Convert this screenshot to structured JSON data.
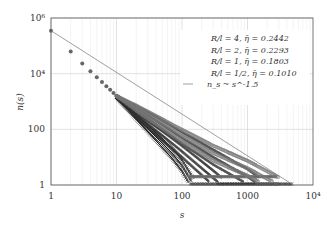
{
  "chart_data": {
    "type": "scatter",
    "title": "",
    "xlabel": "s",
    "ylabel": "n(s)",
    "xscale": "log",
    "yscale": "log",
    "xlim": [
      1,
      10000
    ],
    "ylim": [
      1,
      1000000
    ],
    "grid": true,
    "legend_position": "upper right",
    "x_ticks": [
      "1",
      "10",
      "100",
      "1000",
      "10^4"
    ],
    "y_ticks": [
      "1",
      "100",
      "10^4",
      "10^6"
    ],
    "series": [
      {
        "name": "R/l = 4, η̄ = 0.2442",
        "marker": "×",
        "color": "#111111",
        "approx_cutoff_s": 150,
        "max_s": 5000,
        "points": [
          [
            1,
            350000
          ],
          [
            2,
            60000
          ],
          [
            3,
            22000
          ],
          [
            5,
            7000
          ],
          [
            10,
            1400
          ],
          [
            20,
            280
          ],
          [
            40,
            55
          ],
          [
            70,
            14
          ],
          [
            100,
            5
          ],
          [
            150,
            1
          ]
        ]
      },
      {
        "name": "R/l = 2, η̄ = 0.2293",
        "marker": "+",
        "color": "#333333",
        "approx_cutoff_s": 400,
        "max_s": 3000,
        "points": [
          [
            1,
            350000
          ],
          [
            2,
            60000
          ],
          [
            3,
            22000
          ],
          [
            5,
            7200
          ],
          [
            10,
            1500
          ],
          [
            20,
            320
          ],
          [
            50,
            60
          ],
          [
            100,
            16
          ],
          [
            200,
            4
          ],
          [
            400,
            1
          ]
        ]
      },
      {
        "name": "R/l = 1, η̄ = 0.1803",
        "marker": "●",
        "color": "#555555",
        "approx_cutoff_s": 1500,
        "max_s": 3000,
        "points": [
          [
            1,
            350000
          ],
          [
            2,
            62000
          ],
          [
            3,
            23000
          ],
          [
            5,
            7400
          ],
          [
            10,
            1550
          ],
          [
            30,
            320
          ],
          [
            100,
            50
          ],
          [
            300,
            10
          ],
          [
            1000,
            2
          ],
          [
            1500,
            1
          ]
        ]
      },
      {
        "name": "R/l = 1/2, η̄ = 0.1010",
        "marker": "□",
        "color": "#777777",
        "approx_cutoff_s": 3000,
        "max_s": 3000,
        "points": [
          [
            1,
            350000
          ],
          [
            2,
            62000
          ],
          [
            3,
            23000
          ],
          [
            5,
            7500
          ],
          [
            10,
            1600
          ],
          [
            30,
            330
          ],
          [
            100,
            60
          ],
          [
            300,
            14
          ],
          [
            1000,
            4
          ],
          [
            3000,
            1
          ]
        ]
      }
    ],
    "reference_line": {
      "name": "n_s ~ s^-1.5",
      "exponent": -1.5,
      "from": [
        1,
        350000
      ],
      "to": [
        5000,
        1
      ]
    }
  },
  "legend": {
    "items": [
      {
        "marker": "×",
        "label": "R/l = 4, η̄ = 0.2442"
      },
      {
        "marker": "+",
        "label": "R/l = 2, η̄ = 0.2293"
      },
      {
        "marker": "●",
        "label": "R/l = 1, η̄ = 0.1803"
      },
      {
        "marker": "□",
        "label": "R/l = 1/2, η̄ = 0.1010"
      },
      {
        "marker": "—",
        "label": "n_s ~ s^-1.5"
      }
    ]
  },
  "axes": {
    "x_label": "s",
    "y_label": "n(s)",
    "x_tick_labels": [
      "1",
      "10",
      "100",
      "1000",
      "10⁴"
    ],
    "y_tick_labels": [
      "1",
      "100",
      "10⁴",
      "10⁶"
    ]
  }
}
